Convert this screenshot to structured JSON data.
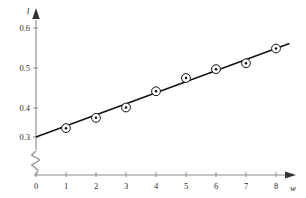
{
  "chart_data": {
    "type": "scatter",
    "title": "",
    "xlabel": "w",
    "ylabel": "l",
    "x": [
      1,
      2,
      3,
      4,
      5,
      6,
      7,
      8
    ],
    "values": [
      0.33,
      0.365,
      0.4,
      0.455,
      0.5,
      0.53,
      0.55,
      0.6
    ],
    "series": [
      {
        "name": "measurements",
        "marker": "circle-with-center-dot",
        "values": [
          0.33,
          0.365,
          0.4,
          0.455,
          0.5,
          0.53,
          0.55,
          0.6
        ]
      },
      {
        "name": "fitted-line",
        "type": "line",
        "x": [
          0,
          8.45
        ],
        "values": [
          0.3,
          0.617
        ]
      }
    ],
    "xlim": [
      0,
      8.8
    ],
    "ylim": [
      0.28,
      0.63
    ],
    "xticks": [
      0,
      1,
      2,
      3,
      4,
      5,
      6,
      7,
      8
    ],
    "xtick_labels": [
      "0",
      "1",
      "2",
      "3",
      "4",
      "5",
      "6",
      "7",
      "8"
    ],
    "yticks": [
      0.3,
      0.4,
      0.5,
      0.6
    ],
    "ytick_labels": [
      "0.3",
      "0.4",
      "0.5",
      "0.6"
    ],
    "grid": false,
    "legend": "none",
    "y_axis_break": true,
    "axis_arrows": true,
    "annotations": []
  },
  "axes": {
    "y_title": "l",
    "x_title": "w",
    "y_tick_labels": [
      "0.6",
      "0.5",
      "0.4",
      "0.3"
    ],
    "x_tick_labels": [
      "0",
      "1",
      "2",
      "3",
      "4",
      "5",
      "6",
      "7",
      "8"
    ]
  },
  "colors": {
    "axis": "#8a8a8a",
    "line": "#111111",
    "marker_stroke": "#111111",
    "marker_fill": "#ffffff",
    "marker_dot": "#111111",
    "text": "#2b2b2b",
    "background": "#ffffff"
  }
}
